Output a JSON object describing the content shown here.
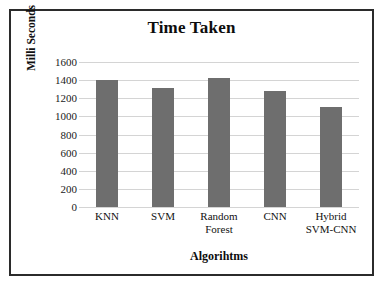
{
  "chart_data": {
    "type": "bar",
    "title": "Time Taken",
    "xlabel": "Algorihtms",
    "ylabel": "Milli Seconds",
    "categories": [
      "KNN",
      "SVM",
      "Random Forest",
      "CNN",
      "Hybrid SVM-CNN"
    ],
    "category_lines": [
      [
        "KNN"
      ],
      [
        "SVM"
      ],
      [
        "Random",
        "Forest"
      ],
      [
        "CNN"
      ],
      [
        "Hybrid",
        "SVM-CNN"
      ]
    ],
    "values": [
      1400,
      1310,
      1425,
      1285,
      1100
    ],
    "ylim": [
      0,
      1600
    ],
    "ytick_step": 200,
    "ytick_labels": [
      "1600",
      "1400",
      "1200",
      "1000",
      "800",
      "600",
      "400",
      "200",
      "0"
    ],
    "ytick_values": [
      1600,
      1400,
      1200,
      1000,
      800,
      600,
      400,
      200,
      0
    ],
    "grid": true,
    "legend": false,
    "series": [
      {
        "name": "Time Taken",
        "values": [
          1400,
          1310,
          1425,
          1285,
          1100
        ]
      }
    ],
    "colors": {
      "bar": "#6E6E6E",
      "gridline": "#D4D4D4",
      "frame_border": "#2B2B2B",
      "background": "#FFFFFF",
      "text": "#111111"
    }
  }
}
